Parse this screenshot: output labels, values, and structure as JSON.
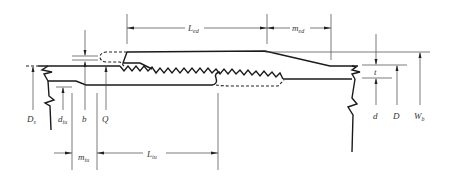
{
  "diagram": {
    "type": "threaded connection cross-section",
    "colors": {
      "line": "#1a1a1a",
      "text": "#333333",
      "background": "#ffffff"
    },
    "labels": {
      "L_ed": {
        "main": "L",
        "sub": "ed"
      },
      "m_ed": {
        "main": "m",
        "sub": "ed"
      },
      "L_iu": {
        "main": "L",
        "sub": "iu"
      },
      "m_iu": {
        "main": "m",
        "sub": "iu"
      },
      "D_s": {
        "main": "D",
        "sub": "s"
      },
      "d_iu": {
        "main": "d",
        "sub": "iu"
      },
      "b": {
        "main": "b",
        "sub": ""
      },
      "Q": {
        "main": "Q",
        "sub": ""
      },
      "t": {
        "main": "t",
        "sub": ""
      },
      "d": {
        "main": "d",
        "sub": ""
      },
      "D": {
        "main": "D",
        "sub": ""
      },
      "W_b": {
        "main": "W",
        "sub": "b"
      }
    }
  }
}
